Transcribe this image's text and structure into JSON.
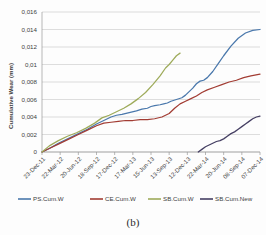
{
  "figure": {
    "caption": "(b)"
  },
  "chart_data": {
    "type": "line",
    "title": "",
    "xlabel": "",
    "ylabel": "Cumulative Wear (mm)",
    "ylim": [
      0,
      0.016
    ],
    "yticks": [
      "0",
      "0,002",
      "0,004",
      "0,006",
      "0,008",
      "0,01",
      "0,012",
      "0,014",
      "0,016"
    ],
    "ytick_values": [
      0,
      0.002,
      0.004,
      0.006,
      0.008,
      0.01,
      0.012,
      0.014,
      0.016
    ],
    "grid": true,
    "legend_position": "bottom",
    "categories": [
      "23-Dec-11",
      "22-Mar-12",
      "20-Jun-12",
      "18-Sep-12",
      "17-Dec-12",
      "17-Mar-13",
      "15-Jun-13",
      "13-Sep-13",
      "12-Dec-13",
      "22-Mar-14",
      "20-Jun-14",
      "08-Sep-14",
      "07-Dec-14"
    ],
    "series": [
      {
        "name": "PS.Cum.W",
        "color": "#4a78ac",
        "x": [
          0,
          0.4,
          0.9,
          1.5,
          2.0,
          2.5,
          3.0,
          3.4,
          3.8,
          4.1,
          4.4,
          4.8,
          5.2,
          5.5,
          5.8,
          6.0,
          6.2,
          6.5,
          6.7,
          6.9,
          7.1,
          7.4,
          7.7,
          7.9,
          8.1,
          8.3,
          8.5,
          8.7,
          8.9,
          9.1,
          9.4,
          9.7,
          10.0,
          10.4,
          10.8,
          11.2,
          11.6,
          12.0
        ],
        "y": [
          0.0,
          0.0004,
          0.001,
          0.0016,
          0.0021,
          0.0026,
          0.0032,
          0.0036,
          0.004,
          0.0042,
          0.0043,
          0.0045,
          0.0047,
          0.0049,
          0.005,
          0.0052,
          0.0053,
          0.0054,
          0.0055,
          0.0056,
          0.0058,
          0.006,
          0.0062,
          0.0065,
          0.0069,
          0.0073,
          0.0078,
          0.0081,
          0.0082,
          0.0085,
          0.0092,
          0.0101,
          0.011,
          0.0121,
          0.013,
          0.0136,
          0.0139,
          0.014
        ]
      },
      {
        "name": "CE.Cum.W",
        "color": "#a23c33",
        "x": [
          0,
          0.4,
          0.9,
          1.5,
          2.0,
          2.5,
          3.0,
          3.4,
          3.8,
          4.2,
          4.6,
          5.0,
          5.4,
          5.8,
          6.2,
          6.6,
          7.0,
          7.3,
          7.6,
          7.9,
          8.2,
          8.5,
          8.8,
          9.1,
          9.5,
          9.9,
          10.3,
          10.7,
          11.1,
          11.5,
          12.0
        ],
        "y": [
          0.0,
          0.0004,
          0.0009,
          0.0015,
          0.002,
          0.0025,
          0.003,
          0.0033,
          0.0034,
          0.0035,
          0.0036,
          0.0036,
          0.0037,
          0.0037,
          0.0038,
          0.004,
          0.0044,
          0.005,
          0.0055,
          0.0058,
          0.0061,
          0.0064,
          0.0068,
          0.0071,
          0.0074,
          0.0077,
          0.008,
          0.0082,
          0.0085,
          0.0087,
          0.0089
        ]
      },
      {
        "name": "SB.Cum.W",
        "color": "#9eab5a",
        "x": [
          0,
          0.4,
          0.9,
          1.4,
          1.9,
          2.4,
          2.9,
          3.3,
          3.7,
          4.1,
          4.5,
          4.9,
          5.3,
          5.7,
          6.1,
          6.5,
          6.8,
          7.0,
          7.2,
          7.4,
          7.6
        ],
        "y": [
          0.0,
          0.0007,
          0.0013,
          0.0018,
          0.0022,
          0.0027,
          0.0033,
          0.0039,
          0.0042,
          0.0046,
          0.005,
          0.0055,
          0.0061,
          0.0068,
          0.0077,
          0.0087,
          0.0096,
          0.01,
          0.0105,
          0.011,
          0.0113
        ]
      },
      {
        "name": "SB.Cum.New",
        "color": "#453f63",
        "x": [
          8.6,
          8.8,
          9.0,
          9.2,
          9.4,
          9.6,
          9.8,
          10.0,
          10.2,
          10.4,
          10.6,
          10.8,
          11.0,
          11.2,
          11.4,
          11.6,
          11.8,
          12.0
        ],
        "y": [
          0.0,
          0.0003,
          0.0006,
          0.0008,
          0.001,
          0.0012,
          0.0013,
          0.0015,
          0.0018,
          0.0021,
          0.0023,
          0.0026,
          0.0029,
          0.0032,
          0.0035,
          0.0038,
          0.004,
          0.0041
        ]
      }
    ]
  }
}
